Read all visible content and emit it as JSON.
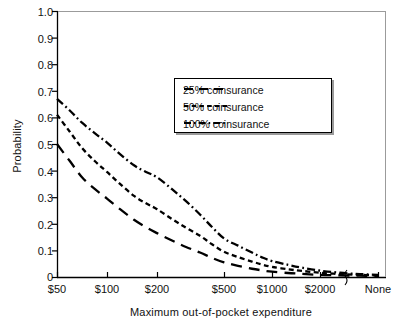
{
  "chart_data": {
    "type": "line",
    "title": "",
    "xlabel": "Maximum out-of-pocket expenditure",
    "ylabel": "Probability",
    "grid": false,
    "legend_position": "upper-center",
    "axis_break": true,
    "ylim": [
      0,
      1.0
    ],
    "yticks": [
      "1.0",
      "0.9",
      "0.8",
      "0.7",
      "0.6",
      "0.5",
      "0.4",
      "0.3",
      "0.2",
      "0.1",
      "0"
    ],
    "ytick_values": [
      1.0,
      0.9,
      0.8,
      0.7,
      0.6,
      0.5,
      0.4,
      0.3,
      0.2,
      0.1,
      0
    ],
    "categories": [
      "$50",
      "$100",
      "$200",
      "$500",
      "$1000",
      "$2000",
      "None"
    ],
    "x_positions": [
      57,
      107,
      157,
      224,
      272,
      320,
      378
    ],
    "series": [
      {
        "name": "25% coinsurance",
        "style": "long-dash",
        "values": [
          0.5,
          0.295,
          0.165,
          0.055,
          0.02,
          0.008,
          0.004
        ],
        "points": [
          [
            57,
            0.5
          ],
          [
            70,
            0.435
          ],
          [
            82,
            0.375
          ],
          [
            95,
            0.33
          ],
          [
            107,
            0.295
          ],
          [
            120,
            0.255
          ],
          [
            134,
            0.215
          ],
          [
            146,
            0.187
          ],
          [
            157,
            0.165
          ],
          [
            172,
            0.137
          ],
          [
            186,
            0.113
          ],
          [
            200,
            0.092
          ],
          [
            212,
            0.072
          ],
          [
            224,
            0.055
          ],
          [
            238,
            0.042
          ],
          [
            252,
            0.031
          ],
          [
            262,
            0.025
          ],
          [
            272,
            0.02
          ],
          [
            288,
            0.015
          ],
          [
            302,
            0.012
          ],
          [
            320,
            0.008
          ],
          [
            340,
            0.006
          ],
          [
            360,
            0.005
          ],
          [
            378,
            0.004
          ]
        ]
      },
      {
        "name": "50% coinsurance",
        "style": "short-dash",
        "values": [
          0.61,
          0.395,
          0.255,
          0.095,
          0.038,
          0.016,
          0.006
        ],
        "points": [
          [
            57,
            0.61
          ],
          [
            70,
            0.545
          ],
          [
            82,
            0.485
          ],
          [
            95,
            0.435
          ],
          [
            107,
            0.395
          ],
          [
            120,
            0.35
          ],
          [
            134,
            0.305
          ],
          [
            146,
            0.277
          ],
          [
            157,
            0.255
          ],
          [
            172,
            0.218
          ],
          [
            186,
            0.185
          ],
          [
            200,
            0.155
          ],
          [
            212,
            0.123
          ],
          [
            224,
            0.095
          ],
          [
            238,
            0.075
          ],
          [
            252,
            0.058
          ],
          [
            262,
            0.047
          ],
          [
            272,
            0.038
          ],
          [
            288,
            0.029
          ],
          [
            302,
            0.023
          ],
          [
            320,
            0.016
          ],
          [
            340,
            0.011
          ],
          [
            360,
            0.008
          ],
          [
            378,
            0.006
          ]
        ]
      },
      {
        "name": "100% coinsurance",
        "style": "dash-dot",
        "values": [
          0.67,
          0.505,
          0.375,
          0.145,
          0.06,
          0.024,
          0.008
        ],
        "points": [
          [
            57,
            0.67
          ],
          [
            70,
            0.625
          ],
          [
            82,
            0.58
          ],
          [
            95,
            0.54
          ],
          [
            107,
            0.505
          ],
          [
            120,
            0.462
          ],
          [
            134,
            0.42
          ],
          [
            146,
            0.395
          ],
          [
            157,
            0.375
          ],
          [
            172,
            0.33
          ],
          [
            186,
            0.285
          ],
          [
            200,
            0.235
          ],
          [
            212,
            0.188
          ],
          [
            224,
            0.145
          ],
          [
            238,
            0.118
          ],
          [
            252,
            0.092
          ],
          [
            262,
            0.074
          ],
          [
            272,
            0.06
          ],
          [
            288,
            0.046
          ],
          [
            302,
            0.035
          ],
          [
            320,
            0.024
          ],
          [
            340,
            0.016
          ],
          [
            360,
            0.011
          ],
          [
            378,
            0.008
          ]
        ]
      }
    ]
  },
  "legend": {
    "items": [
      {
        "label": "25% coinsurance"
      },
      {
        "label": "50% coinsurance"
      },
      {
        "label": "100% coinsurance"
      }
    ]
  },
  "axes": {
    "y_title": "Probability",
    "x_title": "Maximum out-of-pocket expenditure",
    "y_labels": [
      "1.0",
      "0.9",
      "0.8",
      "0.7",
      "0.6",
      "0.5",
      "0.4",
      "0.3",
      "0.2",
      "0.1",
      "0"
    ],
    "x_labels": [
      "$50",
      "$100",
      "$200",
      "$500",
      "$1000",
      "$2000",
      "None"
    ]
  },
  "colors": {
    "line": "#000000",
    "axis": "#000000",
    "background": "#ffffff",
    "text": "#111111",
    "legend_shadow": "#9a9a9a"
  }
}
